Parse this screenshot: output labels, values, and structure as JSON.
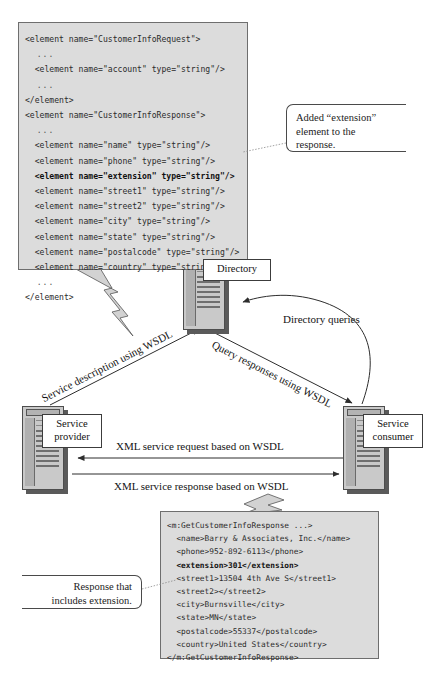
{
  "figure": {
    "type": "web-services-architecture-diagram",
    "accent_code_bg": "#dcdcdc",
    "accent_border": "#6e6e6e"
  },
  "wsdl_code": {
    "name": "wsdl-schema-snippet",
    "lines": [
      {
        "text": "<element name=\"CustomerInfoRequest\">",
        "bold": false
      },
      {
        "text": "  ...",
        "bold": false
      },
      {
        "text": "  <element name=\"account\" type=\"string\"/>",
        "bold": false
      },
      {
        "text": "  ...",
        "bold": false
      },
      {
        "text": "</element>",
        "bold": false
      },
      {
        "text": "<element name=\"CustomerInfoResponse\">",
        "bold": false
      },
      {
        "text": "  ...",
        "bold": false
      },
      {
        "text": "  <element name=\"name\" type=\"string\"/>",
        "bold": false
      },
      {
        "text": "  <element name=\"phone\" type=\"string\"/>",
        "bold": false
      },
      {
        "text": "  <element name=\"extension\" type=\"string\"/>",
        "bold": true
      },
      {
        "text": "  <element name=\"street1\" type=\"string\"/>",
        "bold": false
      },
      {
        "text": "  <element name=\"street2\" type=\"string\"/>",
        "bold": false
      },
      {
        "text": "  <element name=\"city\" type=\"string\"/>",
        "bold": false
      },
      {
        "text": "  <element name=\"state\" type=\"string\"/>",
        "bold": false
      },
      {
        "text": "  <element name=\"postalcode\" type=\"string\"/>",
        "bold": false
      },
      {
        "text": "  <element name=\"country\" type=\"string\"/>",
        "bold": false
      },
      {
        "text": "  ...",
        "bold": false
      },
      {
        "text": "</element>",
        "bold": false
      }
    ]
  },
  "response_code": {
    "name": "soap-response-snippet",
    "lines": [
      {
        "text": "<m:GetCustomerInfoResponse ...>",
        "bold": false
      },
      {
        "text": "  <name>Barry & Associates, Inc.</name>",
        "bold": false
      },
      {
        "text": "  <phone>952-892-6113</phone>",
        "bold": false
      },
      {
        "text": "  <extension>301</extension>",
        "bold": true
      },
      {
        "text": "  <street1>13504 4th Ave S</street1>",
        "bold": false
      },
      {
        "text": "  <street2></street2>",
        "bold": false
      },
      {
        "text": "  <city>Burnsville</city>",
        "bold": false
      },
      {
        "text": "  <state>MN</state>",
        "bold": false
      },
      {
        "text": "  <postalcode>55337</postalcode>",
        "bold": false
      },
      {
        "text": "  <country>United States</country>",
        "bold": false
      },
      {
        "text": "</m:GetCustomerInfoResponse>",
        "bold": false
      }
    ]
  },
  "callouts": {
    "added_extension": {
      "line1": "Added “extension”",
      "line2": "element to the",
      "line3": "response."
    },
    "response_includes": {
      "line1": "Response that",
      "line2": "includes extension."
    }
  },
  "nodes": {
    "directory": {
      "label": "Directory"
    },
    "service_provider": {
      "label_line1": "Service",
      "label_line2": "provider"
    },
    "service_consumer": {
      "label_line1": "Service",
      "label_line2": "consumer"
    }
  },
  "flows": {
    "service_description": "Service description using WSDL",
    "query_responses": "Query responses using WSDL",
    "directory_queries": "Directory queries",
    "xml_request": "XML service request based on WSDL",
    "xml_response": "XML service response based on WSDL"
  }
}
